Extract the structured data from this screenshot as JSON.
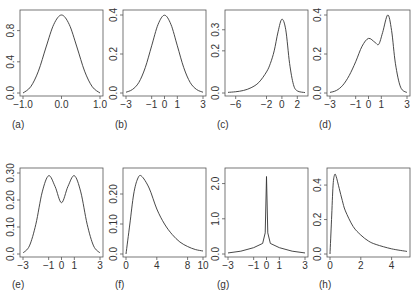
{
  "figure": {
    "captions": [
      "(a)",
      "(b)",
      "(c)",
      "(d)",
      "(e)",
      "(f)",
      "(g)",
      "(h)"
    ]
  },
  "chart_data": [
    {
      "type": "line",
      "panel": "(a)",
      "title": "",
      "xlabel": "",
      "ylabel": "",
      "xlim": [
        -1.0,
        1.0
      ],
      "ylim": [
        0,
        1.0
      ],
      "xticks": [
        -1.0,
        0.0,
        1.0
      ],
      "xtick_labels": [
        "-1.0",
        "0.0",
        "1.0"
      ],
      "yticks": [
        0.0,
        0.4,
        0.8
      ],
      "ytick_labels": [
        "0.0",
        "0.4",
        "0.8"
      ],
      "x": [
        -1.0,
        -0.8,
        -0.6,
        -0.4,
        -0.2,
        0.0,
        0.2,
        0.4,
        0.6,
        0.8,
        1.0
      ],
      "values": [
        0.0,
        0.08,
        0.28,
        0.59,
        0.88,
        1.0,
        0.88,
        0.59,
        0.28,
        0.08,
        0.0
      ],
      "grid": false
    },
    {
      "type": "line",
      "panel": "(b)",
      "title": "",
      "xlim": [
        -3,
        3
      ],
      "ylim": [
        0,
        0.4
      ],
      "xticks": [
        -3,
        -1,
        0,
        1,
        3
      ],
      "xtick_labels": [
        "-3",
        "-1",
        "0",
        "1",
        "3"
      ],
      "yticks": [
        0.0,
        0.2,
        0.4
      ],
      "ytick_labels": [
        "0.0",
        "0.2",
        "0.4"
      ],
      "x": [
        -3,
        -2.5,
        -2,
        -1.5,
        -1,
        -0.5,
        0,
        0.5,
        1,
        1.5,
        2,
        2.5,
        3
      ],
      "values": [
        0.004,
        0.018,
        0.054,
        0.13,
        0.242,
        0.352,
        0.399,
        0.352,
        0.242,
        0.13,
        0.054,
        0.018,
        0.004
      ],
      "grid": false
    },
    {
      "type": "line",
      "panel": "(c)",
      "title": "",
      "xlim": [
        -7,
        3
      ],
      "ylim": [
        0,
        0.37
      ],
      "xticks": [
        -6,
        -2,
        0,
        2
      ],
      "xtick_labels": [
        "-6",
        "-2",
        "0",
        "2"
      ],
      "yticks": [
        0.0,
        0.2,
        0.3
      ],
      "ytick_labels": [
        "0.0",
        "0.2",
        "0.3"
      ],
      "x": [
        -7,
        -6,
        -5,
        -4,
        -3,
        -2,
        -1.5,
        -1,
        -0.5,
        0,
        0.5,
        1,
        1.5,
        2,
        3
      ],
      "values": [
        0.003,
        0.006,
        0.012,
        0.025,
        0.05,
        0.1,
        0.14,
        0.2,
        0.29,
        0.35,
        0.3,
        0.14,
        0.04,
        0.01,
        0.002
      ],
      "grid": false
    },
    {
      "type": "line",
      "panel": "(d)",
      "title": "",
      "xlim": [
        -3,
        3
      ],
      "ylim": [
        0,
        0.4
      ],
      "xticks": [
        -3,
        -1,
        0,
        1,
        3
      ],
      "xtick_labels": [
        "-3",
        "-1",
        "0",
        "1",
        "3"
      ],
      "yticks": [
        0.0,
        0.2,
        0.4
      ],
      "ytick_labels": [
        "0.0",
        "0.2",
        "0.4"
      ],
      "x": [
        -3,
        -2.5,
        -2,
        -1.5,
        -1,
        -0.5,
        0,
        0.5,
        0.8,
        1.1,
        1.5,
        1.8,
        2.1,
        2.5,
        3
      ],
      "values": [
        0.003,
        0.013,
        0.04,
        0.09,
        0.16,
        0.24,
        0.28,
        0.26,
        0.25,
        0.31,
        0.4,
        0.32,
        0.15,
        0.03,
        0.002
      ],
      "grid": false
    },
    {
      "type": "line",
      "panel": "(e)",
      "title": "",
      "xlim": [
        -3,
        3
      ],
      "ylim": [
        0,
        0.3
      ],
      "xticks": [
        -3,
        -1,
        0,
        1,
        3
      ],
      "xtick_labels": [
        "-3",
        "-1",
        "0",
        "1",
        "3"
      ],
      "yticks": [
        0.0,
        0.1,
        0.2,
        0.3
      ],
      "ytick_labels": [
        "0.0",
        "0.10",
        "0.20",
        "0.30"
      ],
      "x": [
        -3,
        -2.5,
        -2,
        -1.5,
        -1,
        -0.5,
        0,
        0.5,
        1,
        1.5,
        2,
        2.5,
        3
      ],
      "values": [
        0.004,
        0.03,
        0.11,
        0.23,
        0.29,
        0.25,
        0.19,
        0.25,
        0.29,
        0.23,
        0.11,
        0.03,
        0.004
      ],
      "grid": false
    },
    {
      "type": "line",
      "panel": "(f)",
      "title": "",
      "xlim": [
        0,
        10
      ],
      "ylim": [
        0,
        0.27
      ],
      "xticks": [
        0,
        4,
        8,
        10
      ],
      "xtick_labels": [
        "0",
        "4",
        "8",
        "10"
      ],
      "yticks": [
        0.0,
        0.1,
        0.2
      ],
      "ytick_labels": [
        "0.0",
        "0.10",
        "0.20"
      ],
      "x": [
        0,
        0.5,
        1,
        1.5,
        2,
        3,
        4,
        5,
        6,
        7,
        8,
        9,
        10
      ],
      "values": [
        0.0,
        0.1,
        0.2,
        0.25,
        0.26,
        0.22,
        0.15,
        0.1,
        0.065,
        0.04,
        0.025,
        0.015,
        0.01
      ],
      "grid": false
    },
    {
      "type": "line",
      "panel": "(g)",
      "title": "",
      "xlim": [
        -3,
        3
      ],
      "ylim": [
        0,
        2.3
      ],
      "xticks": [
        -3,
        -1,
        0,
        1,
        3
      ],
      "xtick_labels": [
        "-3",
        "-1",
        "0",
        "1",
        "3"
      ],
      "yticks": [
        0.0,
        1.0,
        2.0
      ],
      "ytick_labels": [
        "0.0",
        "1.0",
        "2.0"
      ],
      "x": [
        -3,
        -2,
        -1,
        -0.3,
        -0.1,
        0,
        0.1,
        0.3,
        1,
        2,
        3
      ],
      "values": [
        0.03,
        0.08,
        0.18,
        0.3,
        0.6,
        2.2,
        0.6,
        0.3,
        0.18,
        0.08,
        0.03
      ],
      "grid": false
    },
    {
      "type": "line",
      "panel": "(h)",
      "title": "",
      "xlim": [
        0,
        5
      ],
      "ylim": [
        0,
        0.47
      ],
      "xticks": [
        0,
        2,
        4
      ],
      "xtick_labels": [
        "0",
        "2",
        "4"
      ],
      "yticks": [
        0.0,
        0.2,
        0.4
      ],
      "ytick_labels": [
        "0.0",
        "0.2",
        "0.4"
      ],
      "x": [
        0,
        0.1,
        0.2,
        0.3,
        0.4,
        0.6,
        0.8,
        1,
        1.5,
        2,
        2.5,
        3,
        4,
        5
      ],
      "values": [
        0.0,
        0.2,
        0.4,
        0.46,
        0.45,
        0.38,
        0.31,
        0.25,
        0.16,
        0.11,
        0.075,
        0.055,
        0.03,
        0.015
      ],
      "grid": false
    }
  ]
}
